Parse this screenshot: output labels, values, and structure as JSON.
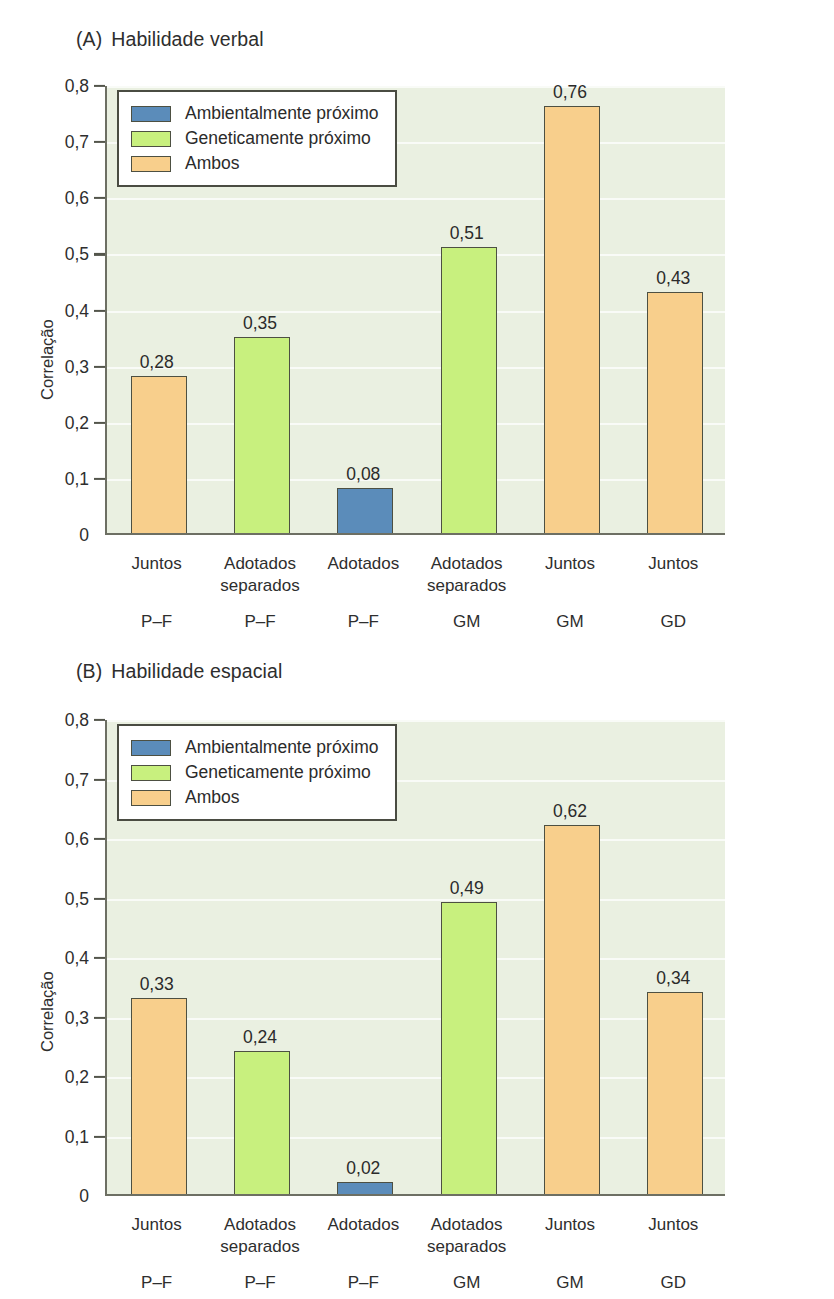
{
  "figure": {
    "background": "#ffffff",
    "plot_background": "#eaf0e1"
  },
  "colors": {
    "environment": "#5b8cba",
    "genetic": "#c8f07e",
    "both": "#f8cf8c",
    "bar_outline": "#4d5042",
    "axis": "#6d6f63",
    "text": "#2b2b2b"
  },
  "legend": {
    "position": "top-left-inside",
    "entries": [
      {
        "key": "environment",
        "label": "Ambientalmente próximo",
        "color": "#5b8cba"
      },
      {
        "key": "genetic",
        "label": "Geneticamente próximo",
        "color": "#c8f07e"
      },
      {
        "key": "both",
        "label": "Ambos",
        "color": "#f8cf8c"
      }
    ]
  },
  "panels": [
    {
      "tag": "(A)",
      "title": "Habilidade verbal",
      "chart_data": {
        "type": "bar",
        "title": "(A)  Habilidade verbal",
        "xlabel": "",
        "ylabel": "Correlação",
        "ylim": [
          0,
          0.8
        ],
        "yticks": [
          0,
          0.1,
          0.2,
          0.3,
          0.4,
          0.5,
          0.6,
          0.7,
          0.8
        ],
        "ytick_labels": [
          "0",
          "0,1",
          "0,2",
          "0,3",
          "0,4",
          "0,5",
          "0,6",
          "0,7",
          "0,8"
        ],
        "grid": true,
        "legend": "top-left",
        "categories": [
          "Juntos",
          "Adotados separados",
          "Adotados",
          "Adotados separados",
          "Juntos",
          "Juntos"
        ],
        "category_lines": [
          [
            "Juntos"
          ],
          [
            "Adotados",
            "separados"
          ],
          [
            "Adotados"
          ],
          [
            "Adotados",
            "separados"
          ],
          [
            "Juntos"
          ],
          [
            "Juntos"
          ]
        ],
        "group_labels": [
          "P–F",
          "P–F",
          "P–F",
          "GM",
          "GM",
          "GD"
        ],
        "values": [
          0.28,
          0.35,
          0.08,
          0.51,
          0.76,
          0.43
        ],
        "value_labels": [
          "0,28",
          "0,35",
          "0,08",
          "0,51",
          "0,76",
          "0,43"
        ],
        "bar_series": [
          "both",
          "genetic",
          "environment",
          "genetic",
          "both",
          "both"
        ],
        "bar_colors": [
          "#f8cf8c",
          "#c8f07e",
          "#5b8cba",
          "#c8f07e",
          "#f8cf8c",
          "#f8cf8c"
        ]
      }
    },
    {
      "tag": "(B)",
      "title": "Habilidade espacial",
      "chart_data": {
        "type": "bar",
        "title": "(B)  Habilidade espacial",
        "xlabel": "",
        "ylabel": "Correlação",
        "ylim": [
          0,
          0.8
        ],
        "yticks": [
          0,
          0.1,
          0.2,
          0.3,
          0.4,
          0.5,
          0.6,
          0.7,
          0.8
        ],
        "ytick_labels": [
          "0",
          "0,1",
          "0,2",
          "0,3",
          "0,4",
          "0,5",
          "0,6",
          "0,7",
          "0,8"
        ],
        "grid": true,
        "legend": "top-left",
        "categories": [
          "Juntos",
          "Adotados separados",
          "Adotados",
          "Adotados separados",
          "Juntos",
          "Juntos"
        ],
        "category_lines": [
          [
            "Juntos"
          ],
          [
            "Adotados",
            "separados"
          ],
          [
            "Adotados"
          ],
          [
            "Adotados",
            "separados"
          ],
          [
            "Juntos"
          ],
          [
            "Juntos"
          ]
        ],
        "group_labels": [
          "P–F",
          "P–F",
          "P–F",
          "GM",
          "GM",
          "GD"
        ],
        "values": [
          0.33,
          0.24,
          0.02,
          0.49,
          0.62,
          0.34
        ],
        "value_labels": [
          "0,33",
          "0,24",
          "0,02",
          "0,49",
          "0,62",
          "0,34"
        ],
        "bar_series": [
          "both",
          "genetic",
          "environment",
          "genetic",
          "both",
          "both"
        ],
        "bar_colors": [
          "#f8cf8c",
          "#c8f07e",
          "#5b8cba",
          "#c8f07e",
          "#f8cf8c",
          "#f8cf8c"
        ]
      }
    }
  ]
}
